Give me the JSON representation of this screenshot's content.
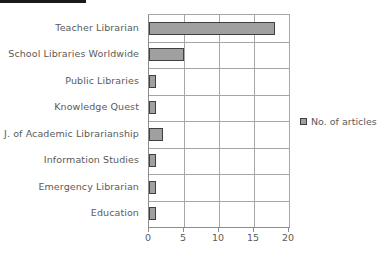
{
  "chart_data": {
    "type": "bar",
    "orientation": "horizontal",
    "title": "",
    "subtitle": "",
    "xlabel": "",
    "ylabel": "",
    "categories": [
      "Teacher Librarian",
      "School Libraries Worldwide",
      "Public Libraries",
      "Knowledge Quest",
      "J. of Academic Librarianship",
      "Information Studies",
      "Emergency Librarian",
      "Education"
    ],
    "series": [
      {
        "name": "No. of articles",
        "values": [
          18,
          5,
          1,
          1,
          2,
          1,
          1,
          1
        ]
      }
    ],
    "values": [
      18,
      5,
      1,
      1,
      2,
      1,
      1,
      1
    ],
    "xlim": [
      0,
      20
    ],
    "xticks": [
      0,
      5,
      10,
      15,
      20
    ],
    "xtick_labels": [
      "0",
      "5",
      "10",
      "15",
      "20"
    ],
    "grid": {
      "vertical": true,
      "horizontal": true
    },
    "legend": {
      "position": "right",
      "entries": [
        "No. of articles"
      ]
    },
    "colors": {
      "bar_fill": "#a0a0a0",
      "bar_border": "#404040",
      "grid": "#a6a6a6",
      "axis": "#8c8c8c",
      "text": "#5a5a5a",
      "background": "#ffffff",
      "artifact_band": "#1a1a1a"
    }
  }
}
